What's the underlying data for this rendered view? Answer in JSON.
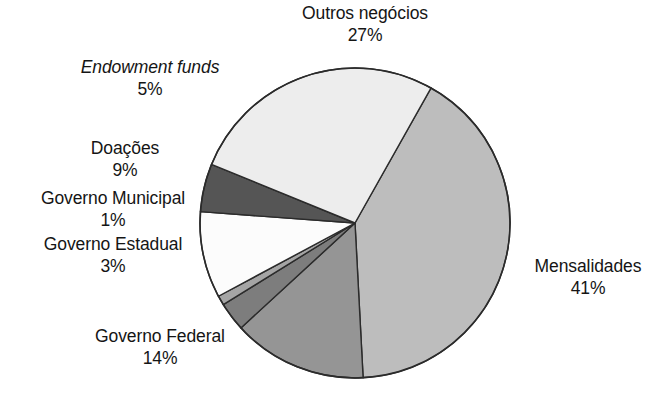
{
  "chart_data": {
    "type": "pie",
    "title": "",
    "subtitle": "",
    "xlabel": "",
    "ylabel": "",
    "legend_position": "none",
    "grid": false,
    "units": "percent",
    "total": 100,
    "start_angle_deg": -60.6,
    "direction": "clockwise",
    "categories": [
      "Mensalidades",
      "Governo Federal",
      "Governo Estadual",
      "Governo Municipal",
      "Doações",
      "Endowment funds",
      "Outros negócios"
    ],
    "values": [
      41,
      14,
      3,
      1,
      9,
      5,
      27
    ],
    "labels": [
      "Mensalidades 41%",
      "Governo Federal 14%",
      "Governo Estadual 3%",
      "Governo Municipal 1%",
      "Doações 9%",
      "Endowment funds 5%",
      "Outros negócios 27%"
    ],
    "colors": [
      "#bdbdbd",
      "#959595",
      "#7d7d7d",
      "#a5a5a5",
      "#fcfcfc",
      "#555555",
      "#ededed"
    ]
  },
  "slices": {
    "mensalidades": {
      "name": "Mensalidades",
      "pct": "41%",
      "value": 41,
      "color": "#bdbdbd"
    },
    "governo_federal": {
      "name": "Governo Federal",
      "pct": "14%",
      "value": 14,
      "color": "#959595"
    },
    "governo_estadual": {
      "name": "Governo Estadual",
      "pct": "3%",
      "value": 3,
      "color": "#7d7d7d"
    },
    "governo_municipal": {
      "name": "Governo Municipal",
      "pct": "1%",
      "value": 1,
      "color": "#a5a5a5"
    },
    "doacoes": {
      "name": "Doações",
      "pct": "9%",
      "value": 9,
      "color": "#fcfcfc"
    },
    "endowment": {
      "name": "Endowment funds",
      "pct": "5%",
      "value": 5,
      "color": "#555555"
    },
    "outros": {
      "name": "Outros negócios",
      "pct": "27%",
      "value": 27,
      "color": "#ededed"
    }
  },
  "style": {
    "background": "#ffffff",
    "outline": "#2b2b2b",
    "text": "#151515"
  }
}
